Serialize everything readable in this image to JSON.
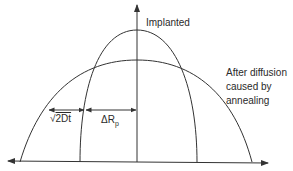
{
  "diagram": {
    "labels": {
      "implanted": "Implanted",
      "after_line1": "After diffusion",
      "after_line2": "caused by",
      "after_line3": "annealing",
      "sqrt_sym": "√",
      "sqrt_arg": "2Dt",
      "delta_r": "ΔR",
      "delta_r_sub": "p"
    },
    "colors": {
      "line": "#333333",
      "text": "#2a2a2a",
      "background": "#ffffff"
    }
  }
}
